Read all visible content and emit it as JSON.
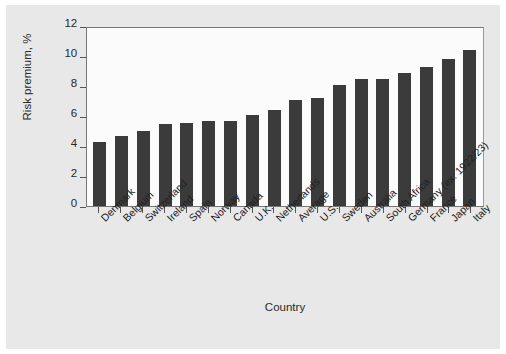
{
  "chart_data": {
    "type": "bar",
    "title": "",
    "xlabel": "Country",
    "ylabel": "Risk premium, %",
    "ylim": [
      0,
      12
    ],
    "yticks": [
      0,
      2,
      4,
      6,
      8,
      10,
      12
    ],
    "grid": false,
    "legend": "none",
    "bar_color": "#3b3b3b",
    "plot_background": "#fbfbfb",
    "figure_background": "#e8e8e8",
    "categories": [
      "Denmark",
      "Belgium",
      "Switzerland",
      "Ireland",
      "Spain",
      "Norway",
      "Canada",
      "U.K.",
      "Netherlands",
      "Average",
      "U.S.",
      "Sweden",
      "Australia",
      "South Africa",
      "Germany (ex. 1922/23)",
      "France",
      "Japan",
      "Italy"
    ],
    "values": [
      4.3,
      4.7,
      5.0,
      5.5,
      5.55,
      5.65,
      5.7,
      6.1,
      6.4,
      7.05,
      7.2,
      8.05,
      8.45,
      8.5,
      8.85,
      9.25,
      9.8,
      10.4
    ]
  }
}
